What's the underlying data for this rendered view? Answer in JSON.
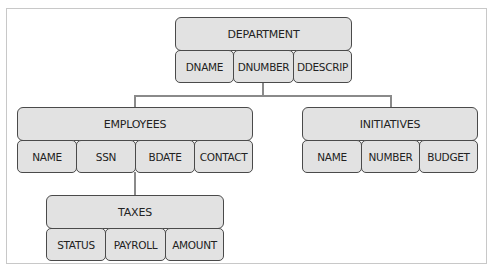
{
  "diagram": {
    "type": "hierarchy",
    "root": {
      "name": "DEPARTMENT",
      "fields": [
        "DNAME",
        "DNUMBER",
        "DDESCRIP"
      ]
    },
    "children": [
      {
        "name": "EMPLOYEES",
        "fields": [
          "NAME",
          "SSN",
          "BDATE",
          "CONTACT"
        ],
        "children": [
          {
            "name": "TAXES",
            "fields": [
              "STATUS",
              "PAYROLL",
              "AMOUNT"
            ]
          }
        ]
      },
      {
        "name": "INITIATIVES",
        "fields": [
          "NAME",
          "NUMBER",
          "BUDGET"
        ]
      }
    ]
  },
  "colors": {
    "box_fill": "#e2e2e2",
    "box_border": "#4a4a4a",
    "connector": "#8a8a8a",
    "frame_border": "#c8c8c8"
  }
}
